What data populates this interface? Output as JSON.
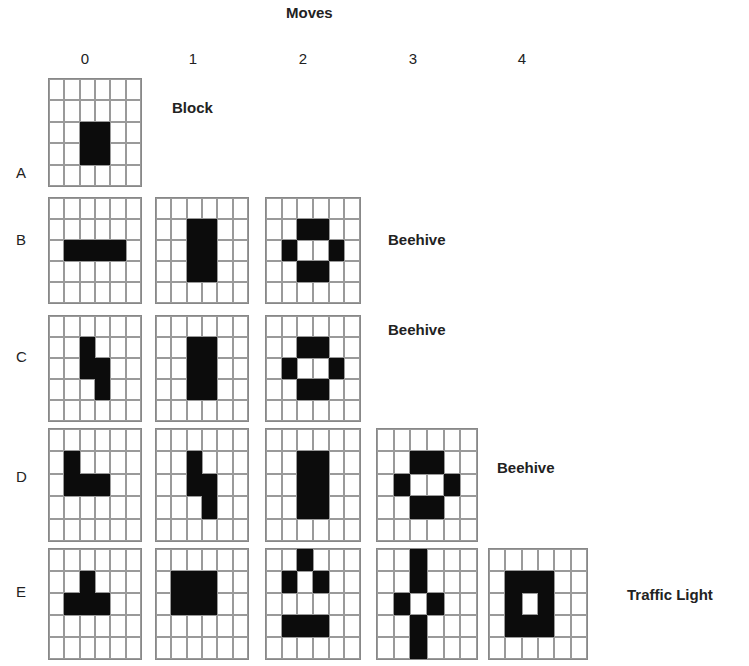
{
  "title": "Moves",
  "moves": [
    "0",
    "1",
    "2",
    "3",
    "4"
  ],
  "rows": [
    {
      "label": "A",
      "result": "Block",
      "result_pos": [
        172,
        108
      ],
      "grids": [
        [
          [
            0,
            0,
            0,
            0,
            0,
            0
          ],
          [
            0,
            0,
            0,
            0,
            0,
            0
          ],
          [
            0,
            0,
            1,
            1,
            0,
            0
          ],
          [
            0,
            0,
            1,
            1,
            0,
            0
          ],
          [
            0,
            0,
            0,
            0,
            0,
            0
          ]
        ]
      ]
    },
    {
      "label": "B",
      "result": "Beehive",
      "result_pos": [
        388,
        240
      ],
      "grids": [
        [
          [
            0,
            0,
            0,
            0,
            0,
            0
          ],
          [
            0,
            0,
            0,
            0,
            0,
            0
          ],
          [
            0,
            1,
            1,
            1,
            1,
            0
          ],
          [
            0,
            0,
            0,
            0,
            0,
            0
          ],
          [
            0,
            0,
            0,
            0,
            0,
            0
          ]
        ],
        [
          [
            0,
            0,
            0,
            0,
            0,
            0
          ],
          [
            0,
            0,
            1,
            1,
            0,
            0
          ],
          [
            0,
            0,
            1,
            1,
            0,
            0
          ],
          [
            0,
            0,
            1,
            1,
            0,
            0
          ],
          [
            0,
            0,
            0,
            0,
            0,
            0
          ]
        ],
        [
          [
            0,
            0,
            0,
            0,
            0,
            0
          ],
          [
            0,
            0,
            1,
            1,
            0,
            0
          ],
          [
            0,
            1,
            0,
            0,
            1,
            0
          ],
          [
            0,
            0,
            1,
            1,
            0,
            0
          ],
          [
            0,
            0,
            0,
            0,
            0,
            0
          ]
        ]
      ]
    },
    {
      "label": "C",
      "result": "Beehive",
      "result_pos": [
        388,
        330
      ],
      "grids": [
        [
          [
            0,
            0,
            0,
            0,
            0,
            0
          ],
          [
            0,
            0,
            1,
            0,
            0,
            0
          ],
          [
            0,
            0,
            1,
            1,
            0,
            0
          ],
          [
            0,
            0,
            0,
            1,
            0,
            0
          ],
          [
            0,
            0,
            0,
            0,
            0,
            0
          ]
        ],
        [
          [
            0,
            0,
            0,
            0,
            0,
            0
          ],
          [
            0,
            0,
            1,
            1,
            0,
            0
          ],
          [
            0,
            0,
            1,
            1,
            0,
            0
          ],
          [
            0,
            0,
            1,
            1,
            0,
            0
          ],
          [
            0,
            0,
            0,
            0,
            0,
            0
          ]
        ],
        [
          [
            0,
            0,
            0,
            0,
            0,
            0
          ],
          [
            0,
            0,
            1,
            1,
            0,
            0
          ],
          [
            0,
            1,
            0,
            0,
            1,
            0
          ],
          [
            0,
            0,
            1,
            1,
            0,
            0
          ],
          [
            0,
            0,
            0,
            0,
            0,
            0
          ]
        ]
      ]
    },
    {
      "label": "D",
      "result": "Beehive",
      "result_pos": [
        497,
        468
      ],
      "grids": [
        [
          [
            0,
            0,
            0,
            0,
            0,
            0
          ],
          [
            0,
            1,
            0,
            0,
            0,
            0
          ],
          [
            0,
            1,
            1,
            1,
            0,
            0
          ],
          [
            0,
            0,
            0,
            0,
            0,
            0
          ],
          [
            0,
            0,
            0,
            0,
            0,
            0
          ]
        ],
        [
          [
            0,
            0,
            0,
            0,
            0,
            0
          ],
          [
            0,
            0,
            1,
            0,
            0,
            0
          ],
          [
            0,
            0,
            1,
            1,
            0,
            0
          ],
          [
            0,
            0,
            0,
            1,
            0,
            0
          ],
          [
            0,
            0,
            0,
            0,
            0,
            0
          ]
        ],
        [
          [
            0,
            0,
            0,
            0,
            0,
            0
          ],
          [
            0,
            0,
            1,
            1,
            0,
            0
          ],
          [
            0,
            0,
            1,
            1,
            0,
            0
          ],
          [
            0,
            0,
            1,
            1,
            0,
            0
          ],
          [
            0,
            0,
            0,
            0,
            0,
            0
          ]
        ],
        [
          [
            0,
            0,
            0,
            0,
            0,
            0
          ],
          [
            0,
            0,
            1,
            1,
            0,
            0
          ],
          [
            0,
            1,
            0,
            0,
            1,
            0
          ],
          [
            0,
            0,
            1,
            1,
            0,
            0
          ],
          [
            0,
            0,
            0,
            0,
            0,
            0
          ]
        ]
      ]
    },
    {
      "label": "E",
      "result": "Traffic Light",
      "result_pos": [
        627,
        595
      ],
      "grids": [
        [
          [
            0,
            0,
            0,
            0,
            0,
            0
          ],
          [
            0,
            0,
            1,
            0,
            0,
            0
          ],
          [
            0,
            1,
            1,
            1,
            0,
            0
          ],
          [
            0,
            0,
            0,
            0,
            0,
            0
          ],
          [
            0,
            0,
            0,
            0,
            0,
            0
          ]
        ],
        [
          [
            0,
            0,
            0,
            0,
            0,
            0
          ],
          [
            0,
            1,
            1,
            1,
            0,
            0
          ],
          [
            0,
            1,
            1,
            1,
            0,
            0
          ],
          [
            0,
            0,
            0,
            0,
            0,
            0
          ],
          [
            0,
            0,
            0,
            0,
            0,
            0
          ]
        ],
        [
          [
            0,
            0,
            1,
            0,
            0,
            0
          ],
          [
            0,
            1,
            0,
            1,
            0,
            0
          ],
          [
            0,
            0,
            0,
            0,
            0,
            0
          ],
          [
            0,
            1,
            1,
            1,
            0,
            0
          ],
          [
            0,
            0,
            0,
            0,
            0,
            0
          ]
        ],
        [
          [
            0,
            0,
            1,
            0,
            0,
            0
          ],
          [
            0,
            0,
            1,
            0,
            0,
            0
          ],
          [
            0,
            1,
            0,
            1,
            0,
            0
          ],
          [
            0,
            0,
            1,
            0,
            0,
            0
          ],
          [
            0,
            0,
            1,
            0,
            0,
            0
          ]
        ],
        [
          [
            0,
            0,
            0,
            0,
            0,
            0
          ],
          [
            0,
            1,
            1,
            1,
            0,
            0
          ],
          [
            0,
            1,
            0,
            1,
            0,
            0
          ],
          [
            0,
            1,
            1,
            1,
            0,
            0
          ],
          [
            0,
            0,
            0,
            0,
            0,
            0
          ]
        ]
      ]
    }
  ],
  "layout": {
    "col_x": [
      48,
      155,
      265,
      376,
      488
    ],
    "col_w": [
      92,
      92,
      94,
      100,
      98
    ],
    "row_y": [
      78,
      197,
      315,
      428,
      548
    ],
    "row_h": [
      107,
      105,
      105,
      112,
      110
    ],
    "label_y": [
      173,
      240,
      357,
      477,
      592
    ],
    "colhdr_x": [
      85,
      193,
      303,
      413,
      522
    ]
  }
}
